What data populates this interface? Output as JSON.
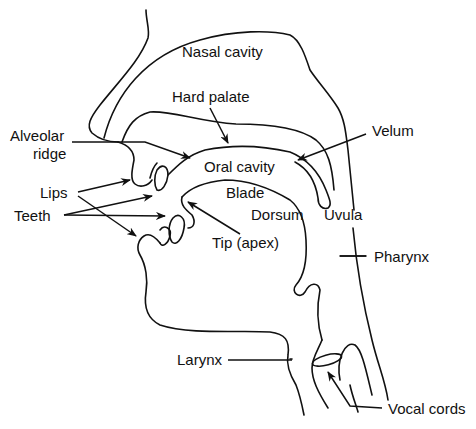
{
  "diagram": {
    "type": "anatomical-cross-section",
    "labels": {
      "nasal_cavity": "Nasal cavity",
      "hard_palate": "Hard palate",
      "alveolar_ridge_1": "Alveolar",
      "alveolar_ridge_2": "ridge",
      "velum": "Velum",
      "oral_cavity": "Oral cavity",
      "lips": "Lips",
      "teeth": "Teeth",
      "blade": "Blade",
      "dorsum": "Dorsum",
      "uvula": "Uvula",
      "tip": "Tip (apex)",
      "pharynx": "Pharynx",
      "larynx": "Larynx",
      "vocal_cords": "Vocal cords"
    },
    "colors": {
      "ink": "#111111",
      "background": "#ffffff"
    }
  }
}
